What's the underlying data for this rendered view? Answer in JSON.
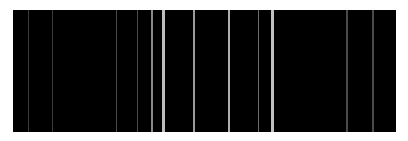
{
  "canvas": {
    "width": 408,
    "height": 141,
    "background": "#ffffff"
  },
  "panel": {
    "left": 13,
    "top": 10,
    "width": 383,
    "height": 122,
    "color": "#000000"
  },
  "stripes": [
    {
      "x": 28,
      "width": 1,
      "color": "#3a3a3a"
    },
    {
      "x": 52,
      "width": 1,
      "color": "#3a3a3a"
    },
    {
      "x": 116,
      "width": 1,
      "color": "#4a4a4a"
    },
    {
      "x": 137,
      "width": 1,
      "color": "#4a4a4a"
    },
    {
      "x": 151,
      "width": 2,
      "color": "#8a8a8a"
    },
    {
      "x": 162,
      "width": 3,
      "color": "#bdbdbd"
    },
    {
      "x": 193,
      "width": 2,
      "color": "#9a9a9a"
    },
    {
      "x": 228,
      "width": 2,
      "color": "#b0b0b0"
    },
    {
      "x": 258,
      "width": 1,
      "color": "#6a6a6a"
    },
    {
      "x": 271,
      "width": 3,
      "color": "#c0c0c0"
    },
    {
      "x": 346,
      "width": 2,
      "color": "#4a4a4a"
    },
    {
      "x": 372,
      "width": 2,
      "color": "#4a4a4a"
    }
  ]
}
